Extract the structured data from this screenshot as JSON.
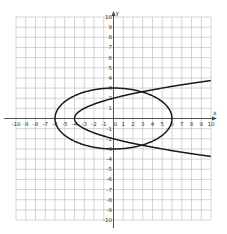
{
  "chart_data": {
    "type": "line",
    "title": "",
    "xlabel": "x",
    "ylabel": "y",
    "xlim": [
      -10,
      10
    ],
    "ylim": [
      -10,
      10
    ],
    "grid": true,
    "legend": null,
    "x_ticks": [
      -10,
      -9,
      -8,
      -7,
      -6,
      -5,
      -4,
      -3,
      -2,
      -1,
      0,
      1,
      2,
      3,
      4,
      5,
      6,
      7,
      8,
      9,
      10
    ],
    "x_tick_labels": [
      "-10",
      "-9",
      "-8",
      "-7",
      "-6",
      "-5",
      "-4",
      "-3",
      "-2",
      "-1",
      "0",
      "1",
      "2",
      "3",
      "4",
      "5",
      "6",
      "7",
      "8",
      "9",
      "10"
    ],
    "y_ticks": [
      -10,
      -9,
      -8,
      -7,
      -6,
      -5,
      -4,
      -3,
      -2,
      -1,
      1,
      2,
      3,
      4,
      5,
      6,
      7,
      8,
      9,
      10
    ],
    "y_tick_labels": [
      "-10",
      "-9",
      "-8",
      "-7",
      "-6",
      "-5",
      "-4",
      "-3",
      "-2",
      "-1",
      "1",
      "2",
      "3",
      "4",
      "5",
      "6",
      "7",
      "8",
      "9",
      "10"
    ],
    "series": [
      {
        "name": "ellipse",
        "kind": "ellipse",
        "equation": "x^2/36 + y^2/9 = 1",
        "center": [
          0,
          0
        ],
        "semi_axis_x": 6,
        "semi_axis_y": 3,
        "key_points": [
          [
            -6,
            0
          ],
          [
            6,
            0
          ],
          [
            0,
            3
          ],
          [
            0,
            -3
          ]
        ]
      },
      {
        "name": "parabola",
        "kind": "parabola",
        "equation": "x = y^2 - 4",
        "vertex": [
          -4,
          0
        ],
        "opens": "right",
        "y_range": [
          -3.74,
          3.74
        ],
        "key_points": [
          [
            -4,
            0
          ],
          [
            0,
            2
          ],
          [
            0,
            -2
          ],
          [
            10,
            3.74
          ],
          [
            10,
            -3.74
          ]
        ]
      }
    ],
    "intersections": [
      [
        3,
        2.6
      ],
      [
        3,
        -2.6
      ]
    ]
  },
  "colors": {
    "grid": "#b8b8b8",
    "axis": "#444444",
    "curve": "#1a1a1a",
    "background": "#ffffff"
  },
  "labels": {
    "x_axis": "x",
    "y_axis": "y"
  }
}
